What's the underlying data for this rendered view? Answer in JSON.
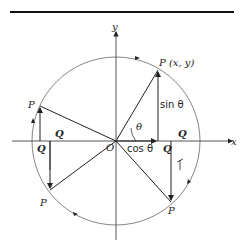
{
  "figure": {
    "axes": {
      "x_label": "x",
      "y_label": "y",
      "origin_label": "O"
    },
    "point_main": "P (x, y)",
    "points": [
      "P",
      "P",
      "P"
    ],
    "q_labels": [
      "Q",
      "Q",
      "Q",
      "Q"
    ],
    "sin_label": "sin θ",
    "cos_label": "cos θ",
    "angle_label": "θ",
    "colors": {
      "line": "#222222",
      "circle": "#555555"
    }
  }
}
